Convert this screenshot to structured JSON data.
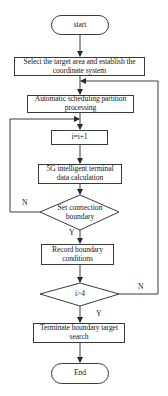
{
  "flowchart": {
    "start": {
      "label": "start"
    },
    "steps": [
      {
        "id": "select",
        "label": "Select the target area and establish the coordinate system"
      },
      {
        "id": "auto",
        "label": "Automatic scheduling partition processing"
      },
      {
        "id": "incr",
        "label": "i=i+1"
      },
      {
        "id": "calc",
        "label": "5G intelligent terminal data calculation"
      },
      {
        "id": "record",
        "label": "Record boundary conditions"
      },
      {
        "id": "terminate",
        "label": "Terminate boundary target search"
      }
    ],
    "decisions": [
      {
        "id": "set_boundary",
        "label": "Set connection boundary",
        "yes": "Y",
        "no": "N"
      },
      {
        "id": "check_i",
        "label": "i>4",
        "yes": "Y",
        "no": "N"
      }
    ],
    "end": {
      "label": "End"
    }
  },
  "colors": {
    "stroke": "#3a3a3a",
    "background": "#ffffff",
    "text": "#1a1a1a"
  }
}
